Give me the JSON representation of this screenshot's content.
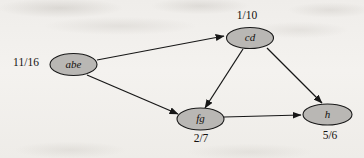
{
  "figure": {
    "type": "directed-graph",
    "background_color": "#f1efec",
    "node_fill_color": "#b9b7b4",
    "node_stroke_color": "#1a1a1a",
    "edge_color": "#171717",
    "text_color": "#14110f"
  },
  "nodes": [
    {
      "id": "abe",
      "label": "abe",
      "time_label": "11/16",
      "time_position": "left",
      "cx": 73.5,
      "cy": 64.5,
      "rx": 23.5,
      "ry": 11,
      "time_x": 26,
      "time_y": 63
    },
    {
      "id": "cd",
      "label": "cd",
      "time_label": "1/10",
      "time_position": "above",
      "cx": 250,
      "cy": 38,
      "rx": 23.5,
      "ry": 10.5,
      "time_x": 247,
      "time_y": 16
    },
    {
      "id": "fg",
      "label": "fg",
      "time_label": "2/7",
      "time_position": "below",
      "cx": 200.5,
      "cy": 119,
      "rx": 23.5,
      "ry": 11,
      "time_x": 201,
      "time_y": 139
    },
    {
      "id": "h",
      "label": "h",
      "time_label": "5/6",
      "time_position": "below",
      "cx": 327.5,
      "cy": 114.5,
      "rx": 24.5,
      "ry": 10.5,
      "time_x": 330,
      "time_y": 136
    }
  ],
  "edges": [
    {
      "from": "abe",
      "to": "cd",
      "x1": 97,
      "y1": 60,
      "x2": 224,
      "y2": 36
    },
    {
      "from": "abe",
      "to": "fg",
      "x1": 87,
      "y1": 75,
      "x2": 178,
      "y2": 114
    },
    {
      "from": "cd",
      "to": "fg",
      "x1": 243,
      "y1": 49,
      "x2": 205,
      "y2": 108
    },
    {
      "from": "cd",
      "to": "h",
      "x1": 267,
      "y1": 48,
      "x2": 322,
      "y2": 103
    },
    {
      "from": "fg",
      "to": "h",
      "x1": 224,
      "y1": 117,
      "x2": 301,
      "y2": 115
    }
  ]
}
